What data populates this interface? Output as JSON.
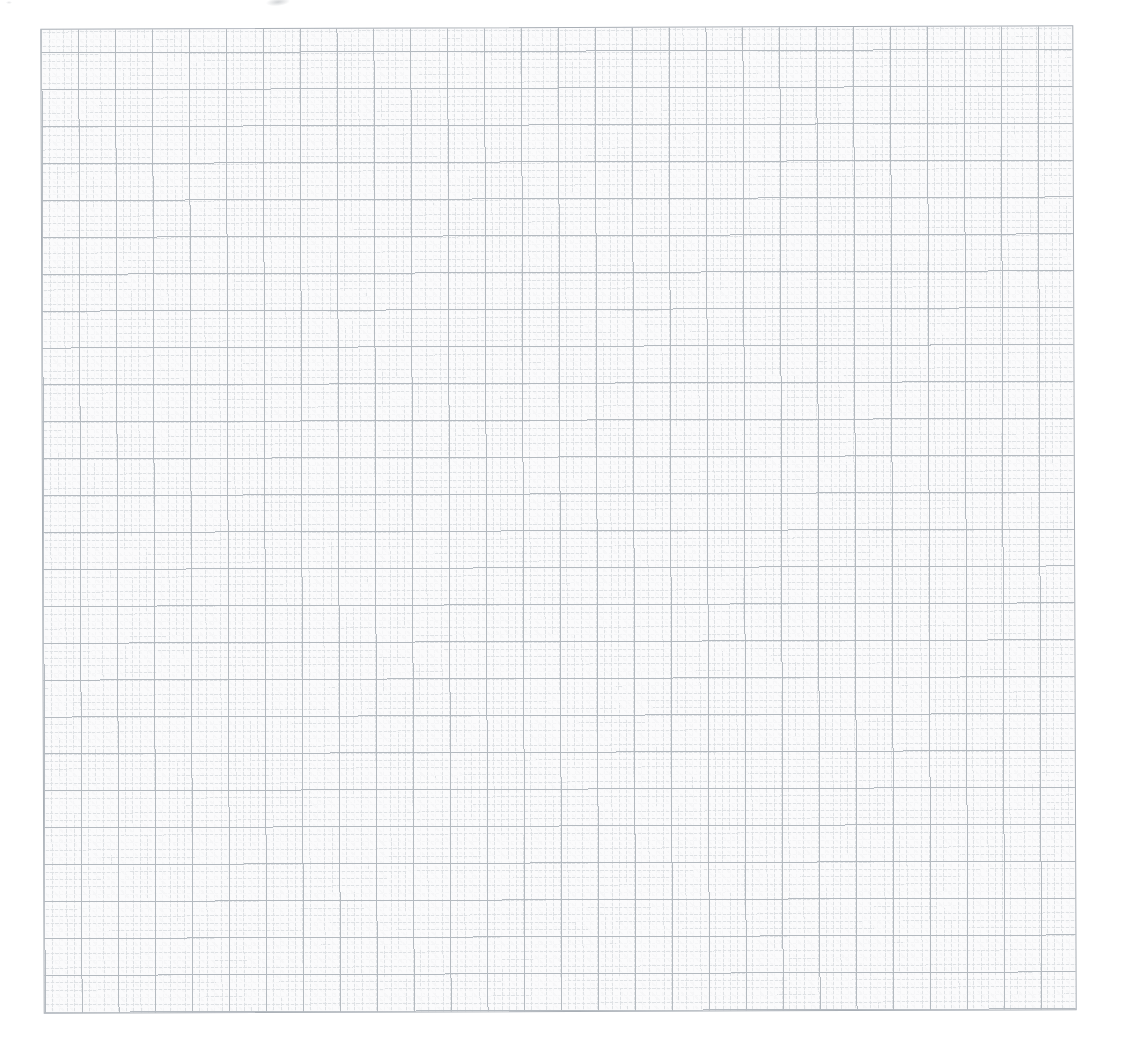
{
  "document": {
    "type": "scanned blank millimeter graph paper sheet",
    "visible_text": ""
  },
  "page": {
    "background_color": "#ffffff"
  },
  "paper": {
    "background_color": "#fbfbfc",
    "fine_line_color": "#dfe2e5",
    "medium_line_color": "#b4bac0",
    "edge_line_color": "#a9afb6",
    "fine_cell_px": 7.37,
    "medium_cell_px": 36.9,
    "fine_cells_per_medium_cell": 5,
    "medium_columns": 28,
    "medium_rows": 27,
    "rotation_deg": -0.2
  },
  "artifacts": {
    "smudge_color": "#c9cccf"
  }
}
